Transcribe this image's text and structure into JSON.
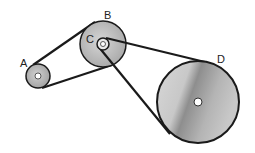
{
  "diagram": {
    "type": "belt-pulley-system",
    "labels": {
      "a": "A",
      "b": "B",
      "c": "C",
      "d": "D"
    },
    "pulleys": [
      {
        "id": "A",
        "cx": 38,
        "cy": 76,
        "r": 12
      },
      {
        "id": "B",
        "cx": 103,
        "cy": 44,
        "r": 23
      },
      {
        "id": "C",
        "cx": 103,
        "cy": 44,
        "r": 6
      },
      {
        "id": "D",
        "cx": 198,
        "cy": 102,
        "r": 41
      }
    ],
    "belts": [
      {
        "from": "A",
        "to": "B"
      },
      {
        "from": "C",
        "to": "D",
        "crossed": true
      }
    ],
    "colors": {
      "belt": "#1a1a1a",
      "pulley_fill_light": "#d4d4d4",
      "pulley_fill_dark": "#9a9a9a",
      "outline": "#1a1a1a"
    }
  }
}
